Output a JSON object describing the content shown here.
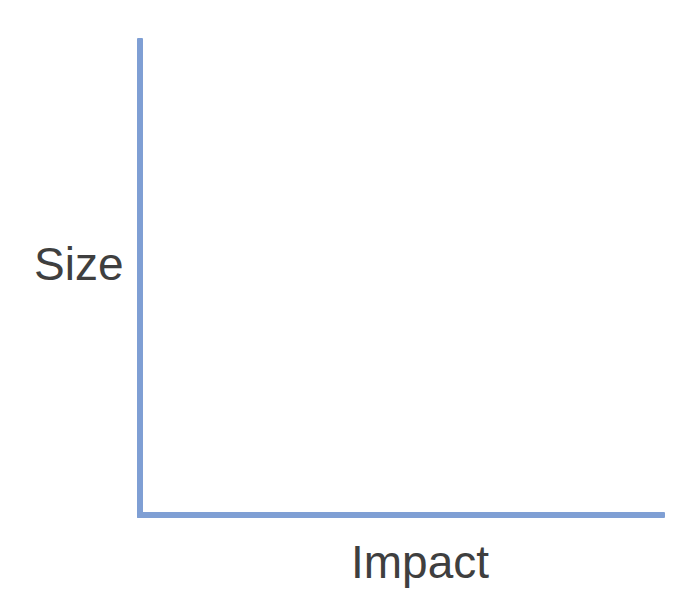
{
  "figure": {
    "background_color": "#ffffff",
    "axis_color": "#7f9fd4",
    "text_color": "#3f3f3f"
  },
  "chart_data": {
    "type": "scatter",
    "title": "",
    "subtitle": "",
    "xlabel": "Impact",
    "ylabel": "Size",
    "x": [],
    "y": [],
    "series": [],
    "categories": [],
    "values": [],
    "xticklabels": [],
    "yticklabels": [],
    "xlim": null,
    "ylim": null,
    "grid": false,
    "legend": false,
    "legend_position": "none",
    "annotations": [],
    "note": "Empty two-axis frame: vertical axis labeled 'Size', horizontal axis labeled 'Impact'. No tick marks, no gridlines, no plotted data points."
  }
}
